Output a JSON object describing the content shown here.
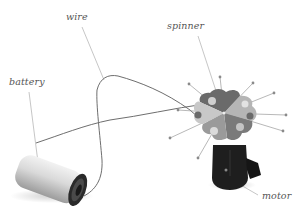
{
  "diagram": {
    "labels": {
      "wire": "wire",
      "battery": "battery",
      "spinner": "spinner",
      "motor": "motor"
    },
    "components": [
      {
        "id": "battery",
        "label": "battery"
      },
      {
        "id": "wire",
        "label": "wire"
      },
      {
        "id": "spinner",
        "label": "spinner"
      },
      {
        "id": "motor",
        "label": "motor"
      }
    ],
    "colors": {
      "background": "#ffffff",
      "label_text": "#555555",
      "leader_line": "#9a9a9a",
      "wire": "#6e6e6e",
      "battery_body": "#d8d8d8",
      "battery_end": "#2a2a2a",
      "spinner_dark": "#6a6a6a",
      "spinner_mid": "#9a9a9a",
      "spinner_light": "#c8c8c8",
      "motor_body": "#1e1e1e"
    }
  }
}
